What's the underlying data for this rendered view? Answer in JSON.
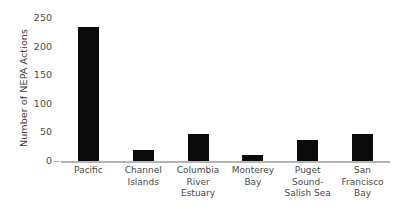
{
  "chart_data": {
    "type": "bar",
    "title": "",
    "subtitle": "",
    "xlabel": "",
    "ylabel": "Number of NEPA Actions",
    "categories": [
      "Pacific",
      "Channel Islands",
      "Columbia River Estuary",
      "Monterey Bay",
      "Puget Sound-Salish Sea",
      "San Francisco Bay"
    ],
    "category_lines": [
      [
        "Pacific"
      ],
      [
        "Channel",
        "Islands"
      ],
      [
        "Columbia",
        "River Estuary"
      ],
      [
        "Monterey",
        "Bay"
      ],
      [
        "Puget Sound-",
        "Salish Sea"
      ],
      [
        "San",
        "Francisco",
        "Bay"
      ]
    ],
    "values": [
      235,
      20,
      47,
      10,
      37,
      48
    ],
    "ylim": [
      0,
      250
    ],
    "yticks": [
      0,
      50,
      100,
      150,
      200,
      250
    ],
    "ytick_labels": [
      "0",
      "50",
      "100",
      "150",
      "200",
      "250"
    ],
    "grid": false,
    "legend": false,
    "legend_position": "none",
    "bar_color": "#0b0b0b",
    "axis_color": "#b5b5b5",
    "text_color": "#4a4a4a"
  }
}
